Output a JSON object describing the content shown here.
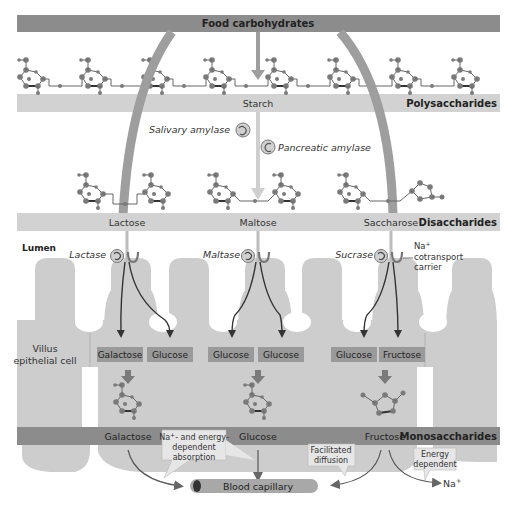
{
  "title": "Food carbohydrates",
  "polysaccharides": {
    "name": "Starch",
    "category": "Polysaccharides"
  },
  "enzymes_upper": {
    "salivary": "Salivary amylase",
    "pancreatic": "Pancreatic amylase"
  },
  "disaccharides": {
    "category": "Disaccharides",
    "items": [
      "Lactose",
      "Maltose",
      "Saccharose"
    ]
  },
  "lumen_label": "Lumen",
  "brush_border_enzymes": [
    "Lactase",
    "Maltase",
    "Sucrase"
  ],
  "carrier_label": {
    "line1": "Na",
    "sup": "+",
    "line2": "cotransport",
    "line3": "carrier"
  },
  "cell_label": {
    "line1": "Villus",
    "line2": "epithelial cell"
  },
  "cell_products": [
    "Galactose",
    "Glucose",
    "Glucose",
    "Glucose",
    "Glucose",
    "Fructose"
  ],
  "monosaccharides": {
    "category": "Monosaccharides",
    "items": [
      "Galactose",
      "Glucose",
      "Fructose"
    ]
  },
  "callouts": {
    "na_energy": {
      "line1": "Na",
      "sup": "+",
      "line1b": "- and energy-",
      "line2": "dependent",
      "line3": "absorption"
    },
    "facilitated": {
      "line1": "Facilitated",
      "line2": "diffusion"
    },
    "energy": {
      "line1": "Energy",
      "line2": "dependent"
    }
  },
  "blood_capillary": "Blood capillary",
  "na_output": {
    "base": "Na",
    "sup": "+"
  },
  "colors": {
    "dark_band": "#8c8c8c",
    "light_band": "#d2d2d2",
    "villus": "#c9c9c9",
    "arrow": "#9a9a9a",
    "molecule": "#7a7a7a",
    "box": "#9a9a9a",
    "capillary": "#a3a3a3"
  }
}
